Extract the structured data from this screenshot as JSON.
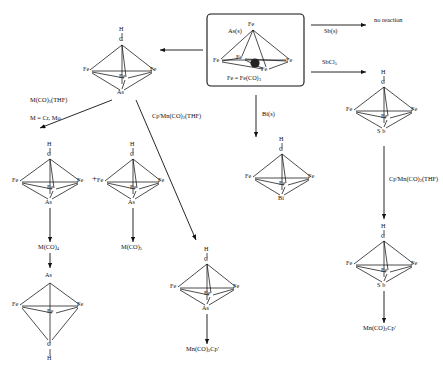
{
  "diagram": {
    "box_caption_pre": "Fe = Fe(CO)",
    "box_caption_sub": "3",
    "labels": {
      "H": "H",
      "C": "C",
      "Fe": "Fe",
      "As": "As",
      "Sb": "S b",
      "Bi": "Bi",
      "plus": "+"
    },
    "reagents": {
      "as_s": "As(s)",
      "sb_s": "Sb(s)",
      "sbcl5_pre": "SbCl",
      "sbcl5_sub": "5",
      "bi_s": "Bi(s)",
      "m_co5_thf_pre": "M(CO)",
      "m_co5_thf_sub": "5",
      "m_co5_thf_post": "(THF)",
      "m_is": "M = Cr, Mo",
      "cpmn_pre": "Cp'Mn(CO)",
      "cpmn_sub": "2",
      "cpmn_post": "(THF)",
      "cpmn_right_pre": "Cp'Mn(CO)",
      "cpmn_right_sub": "2",
      "cpmn_right_post": "(THF)"
    },
    "products": {
      "no_reaction": "no  reaction",
      "m_co4_pre": "M(CO)",
      "m_co4_sub": "4",
      "m_co5_pre": "M(CO)",
      "m_co5_sub": "5",
      "mn_co2cp_pre": "Mn(CO)",
      "mn_co2cp_sub": "2",
      "mn_co2cp_post": "Cp'",
      "mn_co2cp_right_pre": "Mn(CO)",
      "mn_co2cp_right_sub": "2",
      "mn_co2cp_right_post": "Cp'"
    },
    "colors": {
      "ink": "#111111",
      "background": "#ffffff"
    }
  }
}
